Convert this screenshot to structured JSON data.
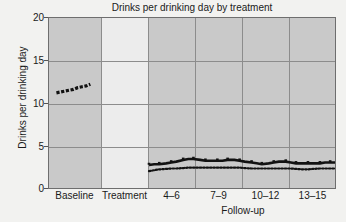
{
  "chart_data": {
    "type": "line",
    "title": "Drinks per drinking day by treatment",
    "xlabel": "Follow-up",
    "ylabel": "Drinks per drinking day",
    "ylim": [
      0,
      20
    ],
    "yticks": [
      0,
      5,
      10,
      15,
      20
    ],
    "grid": true,
    "legend": "none",
    "panels": [
      {
        "label": "Baseline",
        "shaded": true
      },
      {
        "label": "Treatment",
        "shaded": false
      },
      {
        "label": "4–6",
        "shaded": true
      },
      {
        "label": "7–9",
        "shaded": true
      },
      {
        "label": "10–12",
        "shaded": true
      },
      {
        "label": "13–15",
        "shaded": true
      }
    ],
    "series": [
      {
        "name": "baseline-series",
        "style": "dashed-thick",
        "panel": "Baseline",
        "x": [
          0.14,
          0.22,
          0.3,
          0.38,
          0.46,
          0.54,
          0.62,
          0.7,
          0.78
        ],
        "values": [
          11.3,
          11.4,
          11.5,
          11.6,
          11.7,
          11.9,
          12.0,
          12.1,
          12.3
        ]
      },
      {
        "name": "follow-up-solid-series",
        "style": "solid-thick",
        "panel": "Follow-up",
        "x": [
          4,
          4.3,
          4.6,
          5,
          5.3,
          5.6,
          6,
          6.3,
          6.6,
          7,
          7.3,
          7.6,
          8,
          8.3,
          8.6,
          9,
          9.3,
          9.6,
          10,
          10.3,
          10.6,
          11,
          11.3,
          11.6,
          12,
          12.3,
          12.6,
          13,
          13.3,
          13.6,
          14,
          14.3,
          14.6,
          15
        ],
        "values": [
          2.9,
          3.0,
          3.0,
          3.1,
          3.2,
          3.3,
          3.5,
          3.6,
          3.6,
          3.5,
          3.4,
          3.4,
          3.4,
          3.4,
          3.5,
          3.5,
          3.4,
          3.3,
          3.2,
          3.1,
          3.0,
          3.1,
          3.2,
          3.3,
          3.3,
          3.2,
          3.1,
          3.1,
          3.1,
          3.1,
          3.1,
          3.2,
          3.2,
          3.2
        ]
      },
      {
        "name": "follow-up-dotted-series",
        "style": "dotted",
        "panel": "Follow-up",
        "x": [
          4,
          4.3,
          4.6,
          5,
          5.3,
          5.6,
          6,
          6.3,
          6.6,
          7,
          7.3,
          7.6,
          8,
          8.3,
          8.6,
          9,
          9.3,
          9.6,
          10,
          10.3,
          10.6,
          11,
          11.3,
          11.6,
          12,
          12.3,
          12.6,
          13,
          13.3,
          13.6,
          14,
          14.3,
          14.6,
          15
        ],
        "values": [
          2.2,
          2.3,
          2.4,
          2.45,
          2.5,
          2.5,
          2.55,
          2.6,
          2.6,
          2.6,
          2.6,
          2.6,
          2.6,
          2.6,
          2.6,
          2.6,
          2.6,
          2.55,
          2.5,
          2.5,
          2.5,
          2.5,
          2.5,
          2.5,
          2.5,
          2.5,
          2.45,
          2.4,
          2.4,
          2.45,
          2.5,
          2.5,
          2.5,
          2.5
        ]
      }
    ]
  }
}
